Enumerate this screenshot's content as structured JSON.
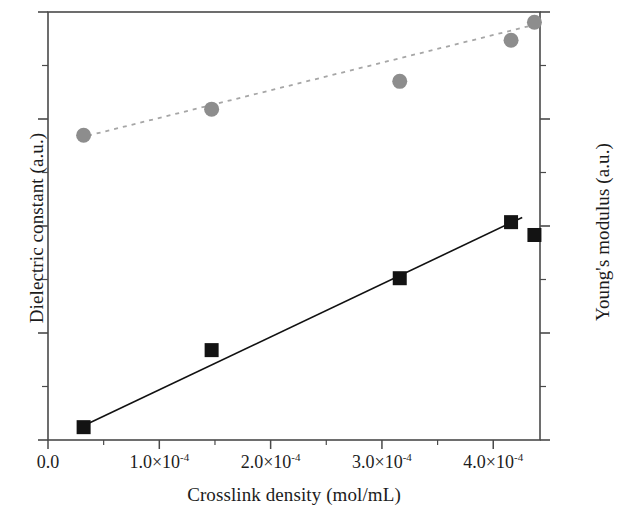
{
  "chart_data": {
    "type": "scatter",
    "title": "",
    "xlabel": "Crosslink density (mol/mL)",
    "ylabel_left": "Dielectric constant (a.u.)",
    "ylabel_right": "Young's modulus (a.u.)",
    "xlim": [
      0.0,
      0.000442
    ],
    "xticks": [
      0.0,
      0.0001,
      0.0002,
      0.0003,
      0.0004
    ],
    "xticklabels": [
      "0.0",
      "1.0×10⁻⁴",
      "2.0×10⁻⁴",
      "3.0×10⁻⁴",
      "4.0×10⁻⁴"
    ],
    "xtick_mantissas": [
      "0.0",
      "1.0×10",
      "2.0×10",
      "3.0×10",
      "4.0×10"
    ],
    "xtick_exponents": [
      "",
      "-4",
      "-4",
      "-4",
      "-4"
    ],
    "ylim_left": [
      0,
      1
    ],
    "ylim_right": [
      0,
      1
    ],
    "yticklabels_left": [],
    "yticklabels_right": [],
    "grid": false,
    "legend": false,
    "legend_position": "none",
    "series": [
      {
        "name": "Dielectric constant",
        "axis": "left",
        "marker": "circle",
        "marker_color": "#8d8d8d",
        "marker_size": 15,
        "line_style": "dashed",
        "line_color": "#a6a6a6",
        "x": [
          3.2e-05,
          0.000147,
          0.000316,
          0.000416,
          0.000437
        ],
        "y": [
          0.712,
          0.773,
          0.838,
          0.934,
          0.976
        ],
        "fit_line": {
          "x0": 2.8e-05,
          "y0": 0.706,
          "x1": 0.00044,
          "y1": 0.972
        }
      },
      {
        "name": "Young's modulus",
        "axis": "right",
        "marker": "square",
        "marker_color": "#131313",
        "marker_size": 14,
        "line_style": "solid",
        "line_color": "#111111",
        "x": [
          3.2e-05,
          0.000147,
          0.000316,
          0.000416,
          0.000437
        ],
        "y": [
          0.03,
          0.21,
          0.378,
          0.509,
          0.479
        ],
        "fit_line": {
          "x0": 3e-05,
          "y0": 0.031,
          "x1": 0.000426,
          "y1": 0.52
        }
      }
    ],
    "annotations": []
  },
  "axes": {
    "x_title": "Crosslink density (mol/mL)",
    "y_left_title": "Dielectric constant (a.u.)",
    "y_right_title": "Young's modulus (a.u.)"
  },
  "style": {
    "frame_color": "#4a4a4a",
    "background": "#ffffff",
    "circle_color": "#8d8d8d",
    "square_color": "#131313",
    "dashed_line_color": "#a6a6a6",
    "solid_line_color": "#111111"
  }
}
